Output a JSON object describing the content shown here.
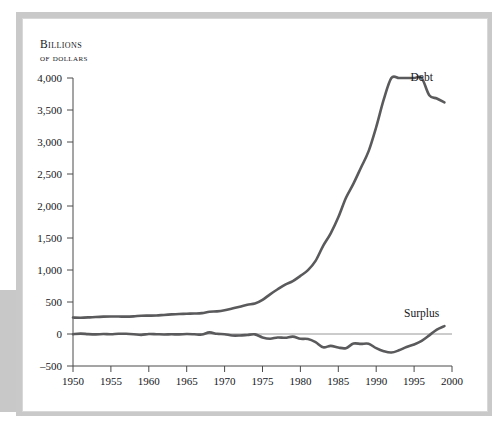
{
  "figure": {
    "axis_title_line1": "Billions",
    "axis_title_line2": "of dollars"
  },
  "chart_data": {
    "type": "line",
    "title": "",
    "subtitle": "",
    "xlabel": "",
    "ylabel": "Billions of dollars",
    "xlim": [
      1950,
      2000
    ],
    "ylim": [
      -500,
      4000
    ],
    "grid": false,
    "legend_position": "inline-end-of-series",
    "x_ticks": [
      1950,
      1955,
      1960,
      1965,
      1970,
      1975,
      1980,
      1985,
      1990,
      1995,
      2000
    ],
    "x_tick_labels": [
      "1950",
      "1955",
      "1960",
      "1965",
      "1970",
      "1975",
      "1980",
      "1985",
      "1990",
      "1995",
      "2000"
    ],
    "y_ticks": [
      -500,
      0,
      500,
      1000,
      1500,
      2000,
      2500,
      3000,
      3500,
      4000
    ],
    "y_tick_labels": [
      "–500",
      "0",
      "500",
      "1,000",
      "1,500",
      "2,000",
      "2,500",
      "3,000",
      "3,500",
      "4,000"
    ],
    "zero_line": 0,
    "line_color": "#5a5a5c",
    "axis_color": "#4a4a4a",
    "annotations": [
      {
        "name": "debt-label",
        "text": "Debt",
        "x": 1996,
        "y": 3960
      },
      {
        "name": "surplus-label",
        "text": "Surplus",
        "x": 1996,
        "y": 270
      }
    ],
    "series": [
      {
        "name": "Debt",
        "label": "Debt",
        "x": [
          1950,
          1951,
          1952,
          1953,
          1954,
          1955,
          1956,
          1957,
          1958,
          1959,
          1960,
          1961,
          1962,
          1963,
          1964,
          1965,
          1966,
          1967,
          1968,
          1969,
          1970,
          1971,
          1972,
          1973,
          1974,
          1975,
          1976,
          1977,
          1978,
          1979,
          1980,
          1981,
          1982,
          1983,
          1984,
          1985,
          1986,
          1987,
          1988,
          1989,
          1990,
          1991,
          1992,
          1993,
          1994,
          1995,
          1996,
          1997,
          1998,
          1999
        ],
        "values": [
          257,
          255,
          259,
          266,
          271,
          274,
          273,
          271,
          276,
          285,
          287,
          289,
          298,
          306,
          312,
          317,
          320,
          326,
          348,
          354,
          371,
          398,
          427,
          458,
          475,
          533,
          620,
          699,
          772,
          827,
          908,
          998,
          1142,
          1377,
          1572,
          1823,
          2125,
          2350,
          2602,
          2857,
          3233,
          3665,
          4065,
          4411,
          4693,
          4921,
          5182,
          3730,
          3680,
          3620
        ]
      },
      {
        "name": "Surplus",
        "label": "Surplus",
        "x": [
          1950,
          1951,
          1952,
          1953,
          1954,
          1955,
          1956,
          1957,
          1958,
          1959,
          1960,
          1961,
          1962,
          1963,
          1964,
          1965,
          1966,
          1967,
          1968,
          1969,
          1970,
          1971,
          1972,
          1973,
          1974,
          1975,
          1976,
          1977,
          1978,
          1979,
          1980,
          1981,
          1982,
          1983,
          1984,
          1985,
          1986,
          1987,
          1988,
          1989,
          1990,
          1991,
          1992,
          1993,
          1994,
          1995,
          1996,
          1997,
          1998,
          1999
        ],
        "values": [
          -3,
          6,
          -2,
          -6,
          -1,
          -3,
          4,
          3,
          -3,
          -13,
          0,
          -3,
          -7,
          -5,
          -6,
          -1,
          -4,
          -9,
          25,
          3,
          -3,
          -23,
          -23,
          -15,
          -6,
          -53,
          -74,
          -54,
          -59,
          -41,
          -74,
          -79,
          -128,
          -208,
          -185,
          -212,
          -221,
          -150,
          -155,
          -153,
          -221,
          -269,
          -290,
          -255,
          -203,
          -164,
          -107,
          -22,
          69,
          124
        ]
      }
    ]
  }
}
